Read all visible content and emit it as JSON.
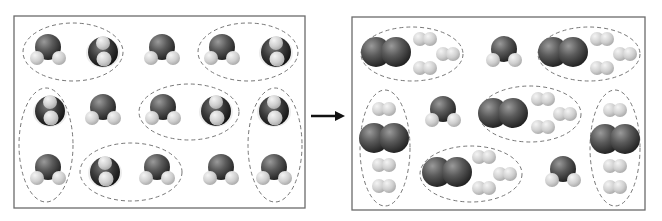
{
  "diagram": {
    "reactants_panel": {
      "box": {
        "x": 14,
        "y": 16,
        "w": 291,
        "h": 192
      },
      "water_molecules": [
        {
          "x": 48,
          "y": 50,
          "view": "side"
        },
        {
          "x": 103,
          "y": 52,
          "view": "top"
        },
        {
          "x": 162,
          "y": 50,
          "view": "side"
        },
        {
          "x": 222,
          "y": 50,
          "view": "side"
        },
        {
          "x": 276,
          "y": 52,
          "view": "top"
        },
        {
          "x": 50,
          "y": 111,
          "view": "top"
        },
        {
          "x": 103,
          "y": 110,
          "view": "side"
        },
        {
          "x": 163,
          "y": 110,
          "view": "side"
        },
        {
          "x": 216,
          "y": 111,
          "view": "top"
        },
        {
          "x": 274,
          "y": 111,
          "view": "top"
        },
        {
          "x": 48,
          "y": 170,
          "view": "side"
        },
        {
          "x": 105,
          "y": 172,
          "view": "top"
        },
        {
          "x": 157,
          "y": 170,
          "view": "side"
        },
        {
          "x": 221,
          "y": 170,
          "view": "side"
        },
        {
          "x": 274,
          "y": 170,
          "view": "side"
        }
      ],
      "groupings": [
        {
          "cx": 73,
          "cy": 52,
          "rx": 50,
          "ry": 29
        },
        {
          "cx": 248,
          "cy": 52,
          "rx": 50,
          "ry": 29
        },
        {
          "cx": 46,
          "cy": 145,
          "rx": 27,
          "ry": 57
        },
        {
          "cx": 189,
          "cy": 112,
          "rx": 50,
          "ry": 28
        },
        {
          "cx": 275,
          "cy": 145,
          "rx": 27,
          "ry": 57
        },
        {
          "cx": 131,
          "cy": 172,
          "rx": 51,
          "ry": 29
        }
      ]
    },
    "arrow": {
      "x1": 311,
      "y1": 116,
      "x2": 345,
      "y2": 116,
      "color": "#111111"
    },
    "products_panel": {
      "box": {
        "x": 352,
        "y": 17,
        "w": 293,
        "h": 193
      },
      "oxygen_molecules": [
        {
          "x": 386,
          "y": 52
        },
        {
          "x": 563,
          "y": 52
        },
        {
          "x": 384,
          "y": 138
        },
        {
          "x": 503,
          "y": 113
        },
        {
          "x": 447,
          "y": 172
        },
        {
          "x": 615,
          "y": 139
        }
      ],
      "hydrogen_molecules": [
        {
          "x": 425,
          "y": 39
        },
        {
          "x": 448,
          "y": 54
        },
        {
          "x": 425,
          "y": 68
        },
        {
          "x": 602,
          "y": 39
        },
        {
          "x": 625,
          "y": 54
        },
        {
          "x": 602,
          "y": 68
        },
        {
          "x": 384,
          "y": 109
        },
        {
          "x": 384,
          "y": 165
        },
        {
          "x": 384,
          "y": 186
        },
        {
          "x": 543,
          "y": 99
        },
        {
          "x": 565,
          "y": 114
        },
        {
          "x": 543,
          "y": 127
        },
        {
          "x": 484,
          "y": 157
        },
        {
          "x": 505,
          "y": 174
        },
        {
          "x": 484,
          "y": 188
        },
        {
          "x": 615,
          "y": 110
        },
        {
          "x": 615,
          "y": 166
        },
        {
          "x": 615,
          "y": 187
        }
      ],
      "water_molecules": [
        {
          "x": 504,
          "y": 52,
          "view": "side"
        },
        {
          "x": 443,
          "y": 112,
          "view": "side"
        },
        {
          "x": 563,
          "y": 172,
          "view": "side"
        }
      ],
      "groupings": [
        {
          "cx": 412,
          "cy": 54,
          "rx": 51,
          "ry": 27
        },
        {
          "cx": 589,
          "cy": 54,
          "rx": 51,
          "ry": 27
        },
        {
          "cx": 385,
          "cy": 148,
          "rx": 25,
          "ry": 58
        },
        {
          "cx": 530,
          "cy": 114,
          "rx": 51,
          "ry": 28
        },
        {
          "cx": 615,
          "cy": 148,
          "rx": 25,
          "ry": 58
        },
        {
          "cx": 471,
          "cy": 174,
          "rx": 51,
          "ry": 28
        }
      ]
    },
    "colors": {
      "oxygen_dark": "#2e2e2e",
      "oxygen_mid": "#6a6a6a",
      "hydrogen": "#c8c8c8",
      "hydrogen_light": "#ececec",
      "box_border": "#6b6b6b",
      "dash": "#777777"
    }
  }
}
